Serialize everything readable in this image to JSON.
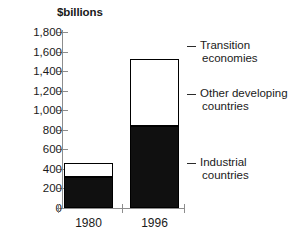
{
  "chart_data": {
    "type": "bar",
    "subtype": "stacked-vertical",
    "title": "",
    "subtitle": "",
    "xlabel": "",
    "ylabel": "$billions",
    "categories": [
      "1980",
      "1996"
    ],
    "ylim": [
      0,
      1800
    ],
    "ytick_values": [
      0,
      200,
      400,
      600,
      800,
      1000,
      1200,
      1400,
      1600,
      1800
    ],
    "ytick_labels": [
      "0",
      "200",
      "400",
      "600",
      "800",
      "1,000",
      "1,200",
      "1,400",
      "1,600",
      "1,800"
    ],
    "grid": false,
    "legend_position": "right",
    "series": [
      {
        "name": "Industrial countries",
        "color": "#101010",
        "values": [
          320,
          840
        ]
      },
      {
        "name": "Other developing countries",
        "color": "#ffffff",
        "values": [
          140,
          680
        ]
      },
      {
        "name": "Transition economies",
        "color": "#ffffff",
        "values": [
          0,
          0
        ]
      }
    ],
    "totals": [
      460,
      1520
    ]
  },
  "axis": {
    "y_title": "$billions",
    "ticks": [
      {
        "label": "1,800",
        "value": 1800
      },
      {
        "label": "1,600",
        "value": 1600
      },
      {
        "label": "1,400",
        "value": 1400
      },
      {
        "label": "1,200",
        "value": 1200
      },
      {
        "label": "1,000",
        "value": 1000
      },
      {
        "label": "800",
        "value": 800
      },
      {
        "label": "600",
        "value": 600
      },
      {
        "label": "400",
        "value": 400
      },
      {
        "label": "200",
        "value": 200
      },
      {
        "label": "0",
        "value": 0
      }
    ],
    "x_categories": [
      {
        "label": "1980"
      },
      {
        "label": "1996"
      }
    ]
  },
  "legend": {
    "items": [
      {
        "line1": "Transition",
        "line2": "economies"
      },
      {
        "line1": "Other developing",
        "line2": "countries"
      },
      {
        "line1": "Industrial",
        "line2": "countries"
      }
    ]
  },
  "colors": {
    "dark": "#101010",
    "light": "#ffffff",
    "outline": "#000000",
    "axis": "#8d8d8d",
    "text": "#1a1a1a"
  }
}
